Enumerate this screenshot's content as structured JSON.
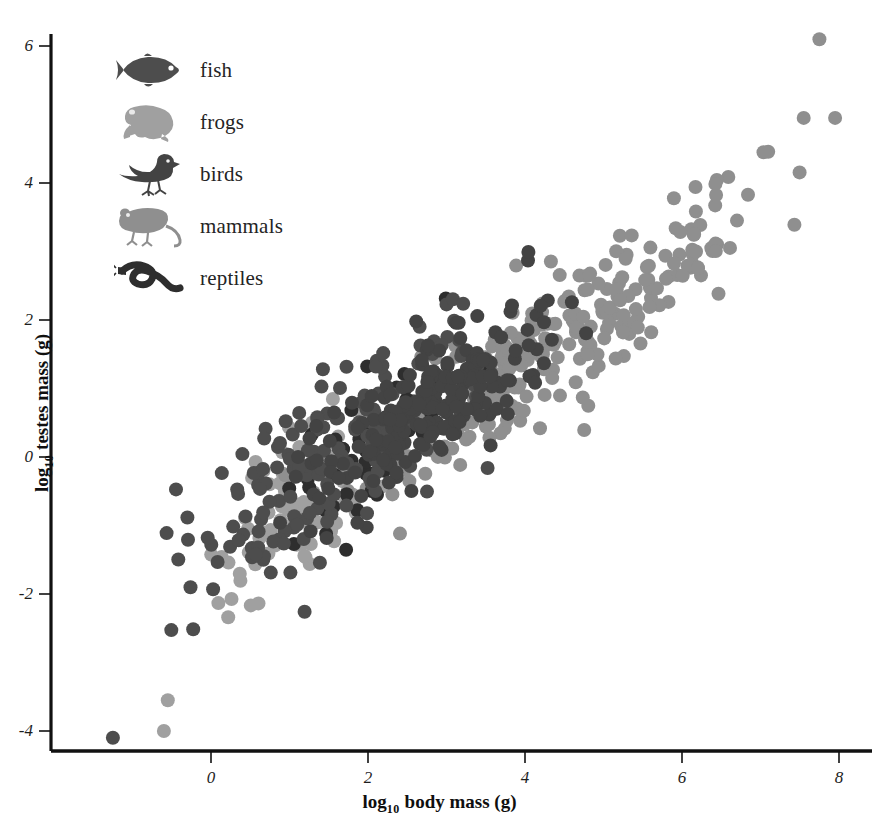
{
  "chart_data": {
    "type": "scatter",
    "title": "",
    "xlabel": "log 10 body mass (g)",
    "ylabel": "log 10 testes mass (g)",
    "xlabel_base": "log",
    "xlabel_sub": "10",
    "xlabel_rest": " body mass (g)",
    "ylabel_base": "log",
    "ylabel_sub": "10",
    "ylabel_rest": " testes mass (g)",
    "xlim": [
      -1.8,
      8.6
    ],
    "ylim": [
      -4.6,
      6.6
    ],
    "xticks": [
      0,
      2,
      4,
      6,
      8
    ],
    "xtick_labels": [
      "0",
      "2",
      "4",
      "6",
      "8"
    ],
    "yticks": [
      -4,
      -2,
      0,
      2,
      4,
      6
    ],
    "ytick_labels": [
      "-4",
      "-2",
      "0",
      "2",
      "4",
      "6"
    ],
    "grid": false,
    "legend_position": "upper-left",
    "marker": "filled-circle",
    "marker_size_px": 14,
    "axis_color": "#111111",
    "background": "#ffffff",
    "note": "Allometric relationship of testes mass to body mass across five vertebrate classes; slope approximately 0.8 on log-log axes.",
    "series": [
      {
        "name": "fish",
        "icon": "fish-icon",
        "color": "#4d4d4d",
        "n": 170,
        "x_range": [
          -1.3,
          4.4
        ],
        "y_intercept": -1.35,
        "slope": 0.86,
        "scatter": 0.62,
        "seed": 11
      },
      {
        "name": "frogs",
        "icon": "frog-icon",
        "color": "#a0a0a0",
        "n": 85,
        "x_range": [
          -0.6,
          2.8
        ],
        "y_intercept": -1.65,
        "slope": 0.9,
        "scatter": 0.52,
        "seed": 29
      },
      {
        "name": "birds",
        "icon": "bird-icon",
        "color": "#434343",
        "n": 215,
        "x_range": [
          0.5,
          5.1
        ],
        "y_intercept": -1.6,
        "slope": 0.83,
        "scatter": 0.48,
        "seed": 47
      },
      {
        "name": "mammals",
        "icon": "mouse-icon",
        "color": "#8f8f8f",
        "n": 290,
        "x_range": [
          0.2,
          8.0
        ],
        "y_intercept": -1.75,
        "slope": 0.78,
        "scatter": 0.5,
        "seed": 73
      },
      {
        "name": "reptiles",
        "icon": "snake-icon",
        "color": "#2e2e2e",
        "n": 60,
        "x_range": [
          0.3,
          3.6
        ],
        "y_intercept": -1.55,
        "slope": 0.8,
        "scatter": 0.5,
        "seed": 97
      }
    ],
    "extreme_points": [
      {
        "x": 7.75,
        "y": 6.1,
        "series": "mammals"
      },
      {
        "x": 7.55,
        "y": 4.95,
        "series": "mammals"
      },
      {
        "x": 7.95,
        "y": 4.95,
        "series": "mammals"
      },
      {
        "x": -1.25,
        "y": -4.1,
        "series": "fish"
      },
      {
        "x": -0.6,
        "y": -4.0,
        "series": "frogs"
      },
      {
        "x": -0.55,
        "y": -3.55,
        "series": "frogs"
      }
    ]
  },
  "legend": {
    "title": "",
    "items": [
      {
        "label": "fish",
        "icon": "fish-icon",
        "color": "#4d4d4d"
      },
      {
        "label": "frogs",
        "icon": "frog-icon",
        "color": "#a0a0a0"
      },
      {
        "label": "birds",
        "icon": "bird-icon",
        "color": "#434343"
      },
      {
        "label": "mammals",
        "icon": "mouse-icon",
        "color": "#8f8f8f"
      },
      {
        "label": "reptiles",
        "icon": "snake-icon",
        "color": "#2e2e2e"
      }
    ]
  },
  "axes": {
    "x_title_base": "log",
    "x_title_sub": "10",
    "x_title_rest": " body mass (g)",
    "y_title_base": "log",
    "y_title_sub": "10",
    "y_title_rest": " testes mass (g)"
  }
}
